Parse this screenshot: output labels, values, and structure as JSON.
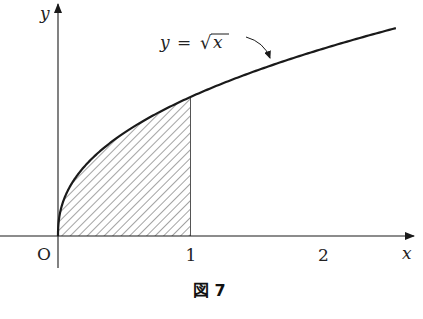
{
  "figure": {
    "caption": "図 7",
    "function_label_lhs": "y",
    "function_label_eq": "=",
    "function_label_rhs": "x",
    "function_label_radical": "√",
    "origin_label": "O",
    "x_axis_label": "x",
    "y_axis_label": "y",
    "x_ticks": [
      {
        "value": 1,
        "label": "1"
      },
      {
        "value": 2,
        "label": "2"
      }
    ],
    "curve": {
      "expression": "y = sqrt(x)",
      "x_range": [
        0,
        2.55
      ]
    },
    "shaded_region": {
      "description": "area under y = sqrt(x) from x = 0 to x = 1",
      "x_from": 0,
      "x_to": 1,
      "pattern": "diagonal-hatch"
    },
    "colors": {
      "ink": "#1a1a1a",
      "hatch": "#555555",
      "background": "#ffffff"
    }
  }
}
